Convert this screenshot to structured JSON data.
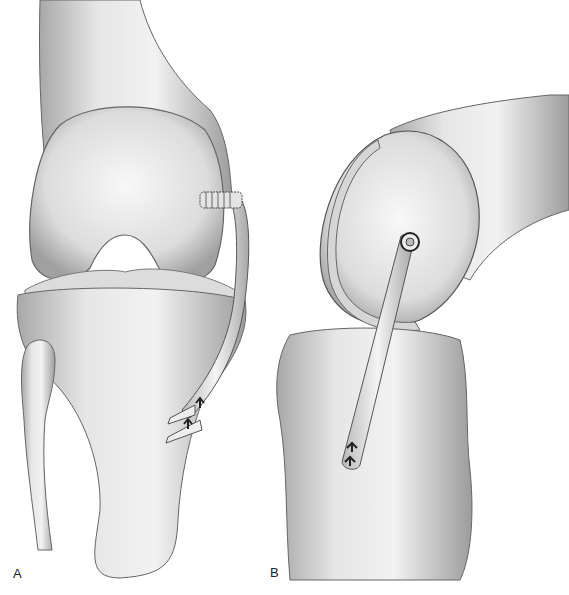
{
  "figure": {
    "panels": [
      {
        "id": "A",
        "label": "A",
        "view": "anterior knee",
        "elements": [
          "femur",
          "femoral-condyles",
          "tibia",
          "fibula",
          "graft",
          "interference-screw",
          "staple-fixation"
        ]
      },
      {
        "id": "B",
        "label": "B",
        "view": "lateral knee",
        "elements": [
          "femur",
          "femoral-condyle",
          "tibia",
          "graft",
          "femoral-fixation-point",
          "tibial-staple-fixation"
        ]
      }
    ],
    "colors": {
      "background": "#ffffff",
      "bone_light": "#eeeeee",
      "bone_mid": "#cfcfcf",
      "bone_dark": "#9a9a9a",
      "outline": "#555555",
      "fixation": "#222222"
    }
  }
}
